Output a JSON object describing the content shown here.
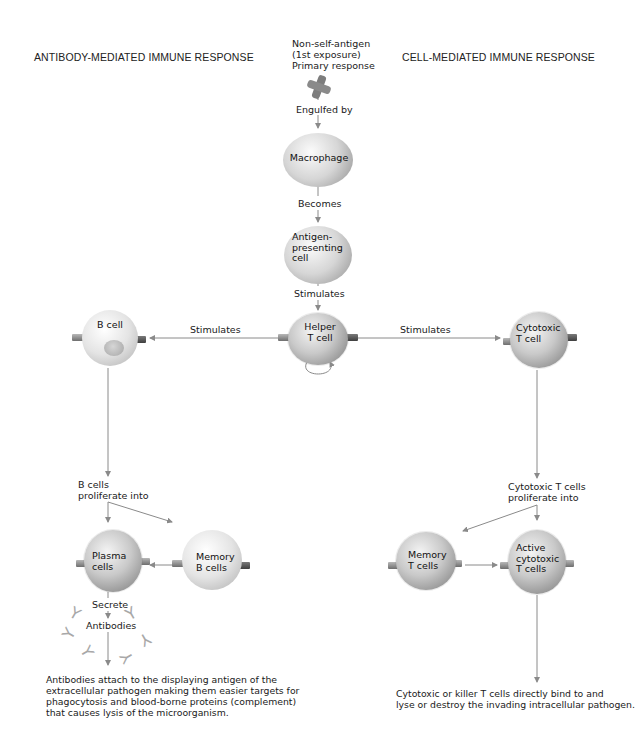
{
  "headers": {
    "left": "ANTIBODY-MEDIATED IMMUNE RESPONSE",
    "right": "CELL-MEDIATED IMMUNE RESPONSE"
  },
  "antigen": {
    "line1": "Non-self-antigen",
    "line2": "(1st exposure)",
    "line3": "Primary response"
  },
  "labels": {
    "engulfed_by": "Engulfed by",
    "becomes": "Becomes",
    "stimulates_down": "Stimulates",
    "stimulates_left": "Stimulates",
    "stimulates_right": "Stimulates",
    "b_cells_proliferate_1": "B cells",
    "b_cells_proliferate_2": "proliferate into",
    "secrete": "Secrete",
    "antibodies": "Antibodies",
    "tc_proliferate_1": "Cytotoxic T cells",
    "tc_proliferate_2": "proliferate into"
  },
  "cells": {
    "macrophage": "Macrophage",
    "apc_1": "Antigen-",
    "apc_2": "presenting",
    "apc_3": "cell",
    "helper_1": "Helper",
    "helper_2": "T cell",
    "bcell": "B cell",
    "cytotoxic_1": "Cytotoxic",
    "cytotoxic_2": "T cell",
    "plasma_1": "Plasma",
    "plasma_2": "cells",
    "memory_b_1": "Memory",
    "memory_b_2": "B cells",
    "memory_t_1": "Memory",
    "memory_t_2": "T cells",
    "active_1": "Active",
    "active_2": "cytotoxic",
    "active_3": "T cells"
  },
  "footer": {
    "left": [
      "Antibodies attach to the displaying antigen of the",
      "extracellular pathogen making them easier targets for",
      "phagocytosis and blood-borne proteins (complement)",
      "that causes lysis of the microorganism."
    ],
    "right": [
      "Cytotoxic or killer T cells directly bind to and",
      "lyse or destroy the invading intracellular pathogen."
    ]
  },
  "colors": {
    "line": "#8a8a8a",
    "antigen": "#7d7d7d",
    "text": "#1a1a1a"
  }
}
